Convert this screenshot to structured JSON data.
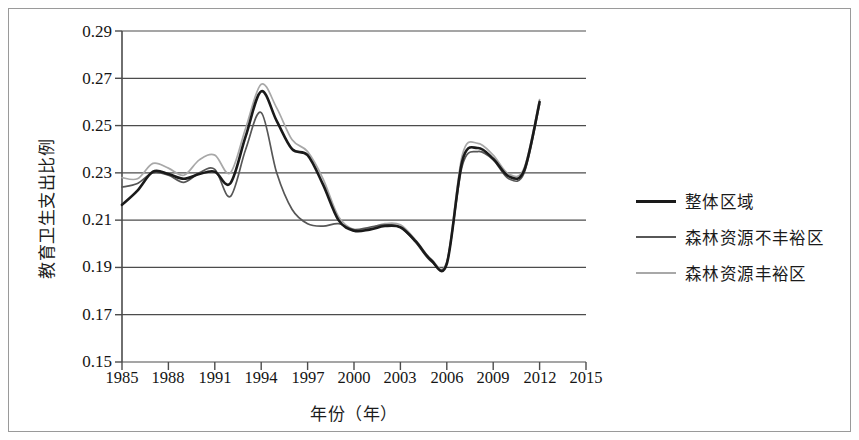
{
  "chart_data": {
    "type": "line",
    "title": "",
    "xlabel": "年份（年）",
    "ylabel": "教育卫生支出比例",
    "xlim": [
      1985,
      2015
    ],
    "ylim": [
      0.15,
      0.29
    ],
    "yticks": [
      "0.29",
      "0.27",
      "0.25",
      "0.23",
      "0.21",
      "0.19",
      "0.17",
      "0.15"
    ],
    "ytick_values": [
      0.29,
      0.27,
      0.25,
      0.23,
      0.21,
      0.19,
      0.17,
      0.15
    ],
    "xticks": [
      "1985",
      "1988",
      "1991",
      "1994",
      "1997",
      "2000",
      "2003",
      "2006",
      "2009",
      "2012",
      "2015"
    ],
    "xtick_values": [
      1985,
      1988,
      1991,
      1994,
      1997,
      2000,
      2003,
      2006,
      2009,
      2012,
      2015
    ],
    "grid": "horizontal",
    "legend_position": "right",
    "x": [
      1985,
      1986,
      1987,
      1988,
      1989,
      1990,
      1991,
      1992,
      1993,
      1994,
      1995,
      1996,
      1997,
      1998,
      1999,
      2000,
      2001,
      2002,
      2003,
      2004,
      2005,
      2006,
      2007,
      2008,
      2009,
      2010,
      2011,
      2012
    ],
    "series": [
      {
        "name": "整体区域",
        "color": "#1a1a1a",
        "width": 2.6,
        "values": [
          0.2165,
          0.2225,
          0.2305,
          0.2295,
          0.2275,
          0.2295,
          0.2305,
          0.2255,
          0.2455,
          0.2645,
          0.252,
          0.24,
          0.2375,
          0.225,
          0.21,
          0.2055,
          0.206,
          0.2075,
          0.207,
          0.201,
          0.193,
          0.1915,
          0.235,
          0.2405,
          0.236,
          0.2285,
          0.231,
          0.26
        ]
      },
      {
        "name": "森林资源不丰裕区",
        "color": "#575757",
        "width": 1.7,
        "values": [
          0.224,
          0.2255,
          0.23,
          0.229,
          0.226,
          0.23,
          0.2315,
          0.22,
          0.24,
          0.2555,
          0.23,
          0.2145,
          0.2085,
          0.2075,
          0.2085,
          0.206,
          0.207,
          0.208,
          0.207,
          0.2005,
          0.1925,
          0.192,
          0.233,
          0.239,
          0.2355,
          0.2275,
          0.23,
          0.259
        ]
      },
      {
        "name": "森林资源丰裕区",
        "color": "#a8a8a8",
        "width": 1.7,
        "values": [
          0.228,
          0.2275,
          0.234,
          0.232,
          0.229,
          0.2355,
          0.2375,
          0.23,
          0.249,
          0.2675,
          0.2575,
          0.244,
          0.239,
          0.2275,
          0.2115,
          0.206,
          0.2065,
          0.2085,
          0.208,
          0.2015,
          0.1935,
          0.1925,
          0.2375,
          0.2425,
          0.2375,
          0.2295,
          0.232,
          0.261
        ]
      }
    ]
  },
  "legend": {
    "items": [
      {
        "label": "整体区域",
        "color": "#1a1a1a",
        "thickness": "3px"
      },
      {
        "label": "森林资源不丰裕区",
        "color": "#575757",
        "thickness": "2px"
      },
      {
        "label": "森林资源丰裕区",
        "color": "#a8a8a8",
        "thickness": "2px"
      }
    ]
  },
  "axes": {
    "y_title": "教育卫生支出比例",
    "x_title": "年份（年）"
  }
}
